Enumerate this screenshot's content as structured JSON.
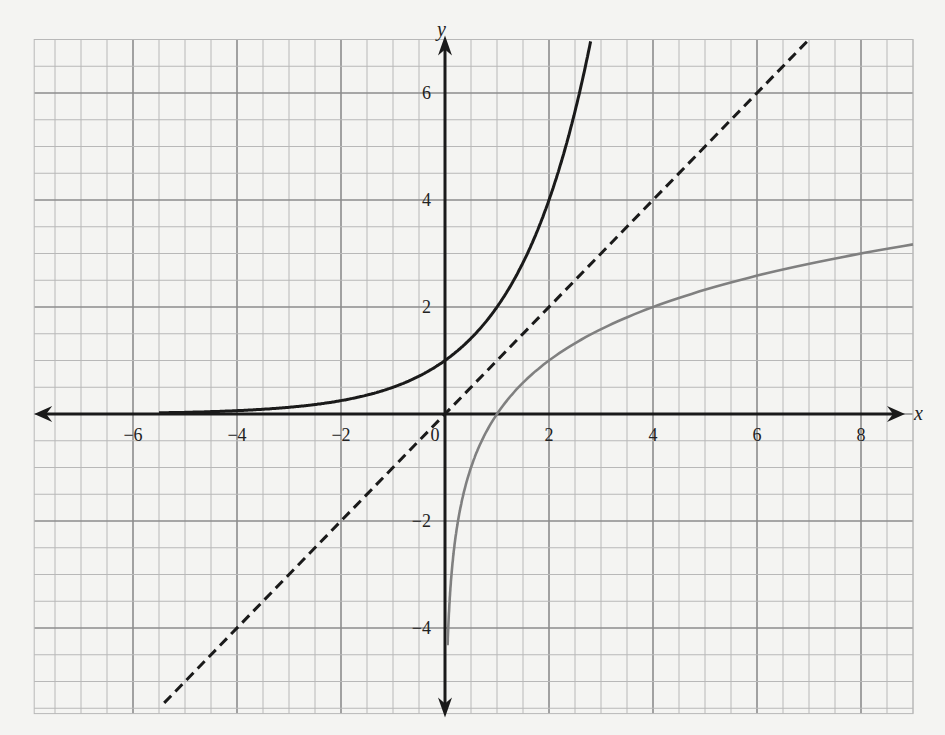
{
  "chart_data": {
    "type": "line",
    "title": "",
    "xlabel": "x",
    "ylabel": "y",
    "xlim": [
      -7.9,
      9.0
    ],
    "ylim": [
      -5.6,
      7.0
    ],
    "grid": true,
    "grid_minor_step": 0.5,
    "grid_major_step": 2,
    "legend": null,
    "x_ticks": [
      -6,
      -4,
      -2,
      0,
      2,
      4,
      6,
      8
    ],
    "x_tick_labels": [
      "−6",
      "−4",
      "−2",
      "0",
      "2",
      "4",
      "6",
      "8"
    ],
    "y_ticks": [
      -4,
      -2,
      2,
      4,
      6
    ],
    "y_tick_labels": [
      "−4",
      "−2",
      "2",
      "4",
      "6"
    ],
    "series": [
      {
        "name": "y = 2^x",
        "style": "solid",
        "color": "#1a1a1a",
        "x": [
          -5.5,
          -4,
          -3,
          -2,
          -1,
          0,
          1,
          2,
          2.5,
          2.8
        ],
        "y": [
          0.022,
          0.0625,
          0.125,
          0.25,
          0.5,
          1,
          2,
          4,
          5.66,
          6.96
        ]
      },
      {
        "name": "y = x",
        "style": "dashed",
        "color": "#1a1a1a",
        "x": [
          -5.4,
          7.0
        ],
        "y": [
          -5.4,
          7.0
        ]
      },
      {
        "name": "y = log2(x)",
        "style": "solid",
        "color": "#808080",
        "x": [
          0.05,
          0.0625,
          0.125,
          0.25,
          0.5,
          1,
          2,
          4,
          6,
          8,
          9
        ],
        "y": [
          -4.32,
          -4,
          -3,
          -2,
          -1,
          0,
          1,
          2,
          2.58,
          3,
          3.17
        ]
      }
    ]
  },
  "labels": {
    "x_axis": "x",
    "y_axis": "y",
    "origin": "0"
  },
  "colors": {
    "paper": "#f4f4f2",
    "grid_minor": "#b8b8b8",
    "grid_major": "#8c8c8c",
    "axis": "#1a1a1a",
    "exp_curve": "#1a1a1a",
    "log_curve": "#808080"
  }
}
